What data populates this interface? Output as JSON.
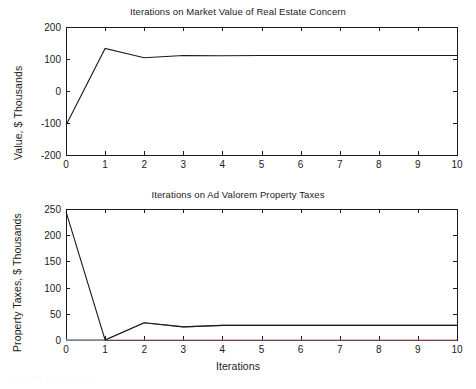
{
  "figure": {
    "width": 476,
    "height": 389,
    "background": "#ffffff",
    "axis_color": "#1b1b1b",
    "faint_caption": "FIGURE 11 Iterations"
  },
  "chart_data": [
    {
      "id": "market-value",
      "type": "line",
      "title": "Iterations on Market Value of Real Estate Concern",
      "xlabel": "",
      "ylabel": "Value, $ Thousands",
      "xlim": [
        0,
        10
      ],
      "ylim": [
        -200,
        200
      ],
      "xticks": [
        0,
        1,
        2,
        3,
        4,
        5,
        6,
        7,
        8,
        9,
        10
      ],
      "xticklabels": [
        "0",
        "1",
        "2",
        "3",
        "4",
        "5",
        "6",
        "7",
        "8",
        "9",
        "10"
      ],
      "yticks": [
        -200,
        -100,
        0,
        100,
        200
      ],
      "yticklabels": [
        "-200",
        "-100",
        "0",
        "100",
        "200"
      ],
      "grid": false,
      "legend": "none",
      "series": [
        {
          "name": "Market Value",
          "color": "#1b1b1b",
          "x": [
            0,
            1,
            2,
            3,
            4,
            5,
            6,
            7,
            8,
            9,
            10
          ],
          "values": [
            -107,
            133,
            104,
            111,
            110,
            111,
            111,
            111,
            111,
            111,
            111
          ]
        }
      ]
    },
    {
      "id": "ad-valorem-property-taxes",
      "type": "line",
      "title": "Iterations on Ad Valorem Property Taxes",
      "xlabel": "Iterations",
      "ylabel": "Property Taxes, $ Thousands",
      "xlim": [
        0,
        10
      ],
      "ylim": [
        0,
        250
      ],
      "xticks": [
        0,
        1,
        2,
        3,
        4,
        5,
        6,
        7,
        8,
        9,
        10
      ],
      "xticklabels": [
        "0",
        "1",
        "2",
        "3",
        "4",
        "5",
        "6",
        "7",
        "8",
        "9",
        "10"
      ],
      "yticks": [
        0,
        50,
        100,
        150,
        200,
        250
      ],
      "yticklabels": [
        "0",
        "50",
        "100",
        "150",
        "200",
        "250"
      ],
      "grid": false,
      "legend": "none",
      "series": [
        {
          "name": "Property Taxes",
          "color": "#1b1b1b",
          "x": [
            0,
            1,
            2,
            3,
            4,
            5,
            6,
            7,
            8,
            9,
            10
          ],
          "values": [
            245,
            0,
            33,
            25,
            28,
            28,
            28,
            28,
            28,
            28,
            28
          ]
        },
        {
          "name": "Upper Band",
          "color": "#5a5ab4",
          "x": [
            0,
            1,
            2,
            3,
            4,
            5,
            6,
            7,
            8,
            9,
            10
          ],
          "values": [
            0,
            0,
            33,
            25,
            28,
            28,
            28,
            28,
            28,
            28,
            28
          ]
        },
        {
          "name": "Lower Band",
          "color": "#c4707e",
          "x": [
            0,
            1,
            2,
            3,
            4,
            5,
            6,
            7,
            8,
            9,
            10
          ],
          "values": [
            0,
            0,
            0,
            0,
            0,
            0,
            0,
            0,
            0,
            0,
            0
          ]
        },
        {
          "name": "Baseline",
          "color": "#7fb0b4",
          "x": [
            0,
            1
          ],
          "values": [
            0,
            0
          ]
        }
      ]
    }
  ]
}
